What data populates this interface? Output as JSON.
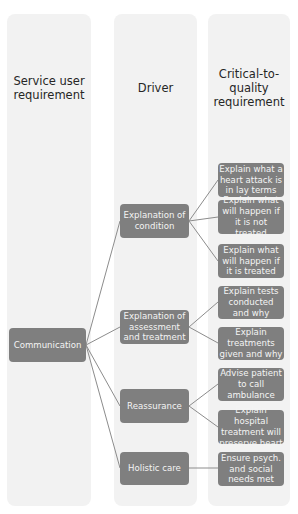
{
  "columns": [
    {
      "id": "col1",
      "header": "Service user requirement"
    },
    {
      "id": "col2",
      "header": "Driver"
    },
    {
      "id": "col3",
      "header": "Critical-to-quality requirement"
    }
  ],
  "headers": {
    "service_user_line1": "Service user",
    "service_user_line2": "requirement",
    "driver": "Driver",
    "ctq_line1": "Critical-to-",
    "ctq_line2": "quality",
    "ctq_line3": "requirement"
  },
  "root": {
    "id": "communication",
    "label": "Communication"
  },
  "drivers": [
    {
      "id": "explanation-of-condition",
      "label": "Explanation of condition"
    },
    {
      "id": "explanation-of-assessment",
      "label": "Explanation of assessment and treatment"
    },
    {
      "id": "reassurance",
      "label": "Reassurance"
    },
    {
      "id": "holistic-care",
      "label": "Holistic care"
    }
  ],
  "requirements": [
    {
      "id": "req-heart-attack-lay-terms",
      "driver": "explanation-of-condition",
      "label": "Explain what a heart attack is in lay terms"
    },
    {
      "id": "req-not-treated",
      "driver": "explanation-of-condition",
      "label": "Explain what will happen if it is not treated"
    },
    {
      "id": "req-treated",
      "driver": "explanation-of-condition",
      "label": "Explain what will happen if it is treated"
    },
    {
      "id": "req-tests",
      "driver": "explanation-of-assessment",
      "label": "Explain tests conducted and why"
    },
    {
      "id": "req-treatments",
      "driver": "explanation-of-assessment",
      "label": "Explain treatments given and why"
    },
    {
      "id": "req-ambulance",
      "driver": "reassurance",
      "label": "Advise patient to call ambulance"
    },
    {
      "id": "req-preserve-heart",
      "driver": "reassurance",
      "label": "Explain hospital treatment will preserve heart"
    },
    {
      "id": "req-psych-social",
      "driver": "holistic-care",
      "label": "Ensure psych. and social needs met"
    }
  ],
  "colors": {
    "box": "#7f7f7f",
    "column_bg": "#f2f2f2",
    "connector": "#8c8c8c",
    "box_text": "#f4f4f4",
    "header_text": "#262626"
  }
}
